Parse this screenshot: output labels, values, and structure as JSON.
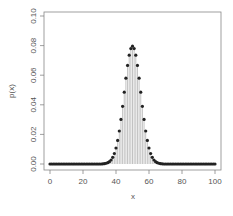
{
  "chart_data": {
    "type": "scatter",
    "subtype": "probability mass function with vertical lines (type='h') and points",
    "title": "",
    "xlabel": "x",
    "ylabel": "p(x)",
    "xlim": [
      0,
      100
    ],
    "ylim": [
      0,
      0.1
    ],
    "x_ticks": [
      0,
      20,
      40,
      60,
      80,
      100
    ],
    "x_tick_labels": [
      "0",
      "20",
      "40",
      "60",
      "80",
      "100"
    ],
    "y_ticks": [
      0.0,
      0.02,
      0.04,
      0.06,
      0.08,
      0.1
    ],
    "y_tick_labels": [
      "0.00",
      "0.02",
      "0.04",
      "0.06",
      "0.08",
      "0.10"
    ],
    "grid": false,
    "legend": null,
    "distribution": {
      "name": "binomial",
      "n": 100,
      "p": 0.5
    },
    "peak": {
      "x": 50,
      "y": 0.0796
    },
    "x": [
      0,
      1,
      2,
      3,
      4,
      5,
      6,
      7,
      8,
      9,
      10,
      11,
      12,
      13,
      14,
      15,
      16,
      17,
      18,
      19,
      20,
      21,
      22,
      23,
      24,
      25,
      26,
      27,
      28,
      29,
      30,
      31,
      32,
      33,
      34,
      35,
      36,
      37,
      38,
      39,
      40,
      41,
      42,
      43,
      44,
      45,
      46,
      47,
      48,
      49,
      50,
      51,
      52,
      53,
      54,
      55,
      56,
      57,
      58,
      59,
      60,
      61,
      62,
      63,
      64,
      65,
      66,
      67,
      68,
      69,
      70,
      71,
      72,
      73,
      74,
      75,
      76,
      77,
      78,
      79,
      80,
      81,
      82,
      83,
      84,
      85,
      86,
      87,
      88,
      89,
      90,
      91,
      92,
      93,
      94,
      95,
      96,
      97,
      98,
      99,
      100
    ],
    "values": [
      0,
      0,
      0,
      0,
      0,
      0,
      0,
      0,
      0,
      0,
      0,
      0,
      0,
      0,
      0,
      0,
      0,
      0,
      0,
      0,
      0,
      0,
      0,
      0,
      0,
      0,
      0,
      0,
      0,
      0,
      0,
      0,
      0.0001,
      0.0002,
      0.0005,
      0.0009,
      0.0016,
      0.0027,
      0.0045,
      0.0071,
      0.0108,
      0.0159,
      0.0223,
      0.0301,
      0.039,
      0.0485,
      0.058,
      0.0666,
      0.0735,
      0.078,
      0.0796,
      0.078,
      0.0735,
      0.0666,
      0.058,
      0.0485,
      0.039,
      0.0301,
      0.0223,
      0.0159,
      0.0108,
      0.0071,
      0.0045,
      0.0027,
      0.0016,
      0.0009,
      0.0005,
      0.0002,
      0.0001,
      0,
      0,
      0,
      0,
      0,
      0,
      0,
      0,
      0,
      0,
      0,
      0,
      0,
      0,
      0,
      0,
      0,
      0,
      0,
      0,
      0,
      0,
      0,
      0,
      0,
      0,
      0,
      0,
      0,
      0,
      0,
      0
    ]
  },
  "colors": {
    "axis": "#777777",
    "box": "#888888",
    "lines": "#999999",
    "points": "#222222",
    "text": "#555555"
  }
}
